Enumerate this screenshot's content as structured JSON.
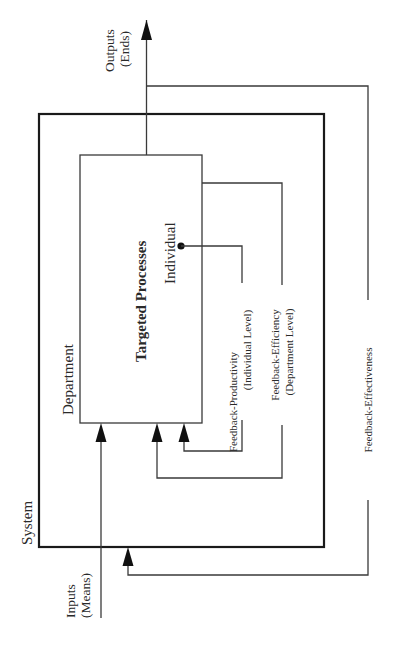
{
  "diagram": {
    "orientation": "rotated-90-ccw",
    "labels": {
      "system": "System",
      "department": "Department",
      "targeted_processes": "Targeted Processes",
      "individual": "Individual",
      "outputs_line1": "Outputs",
      "outputs_line2": "(Ends)",
      "inputs_line1": "Inputs",
      "inputs_line2": "(Means)",
      "fb_productivity_line1": "Feedback-Productivity",
      "fb_productivity_line2": "(Individual Level)",
      "fb_efficiency_line1": "Feedback-Efficiency",
      "fb_efficiency_line2": "(Department Level)",
      "fb_effectiveness": "Feedback-Effectiveness"
    },
    "nodes": [
      {
        "id": "system",
        "label": "System",
        "type": "outer-box"
      },
      {
        "id": "department",
        "label": "Department",
        "type": "region"
      },
      {
        "id": "targeted-processes",
        "label": "Targeted Processes",
        "type": "inner-box"
      },
      {
        "id": "individual",
        "label": "Individual",
        "type": "point"
      }
    ],
    "edges": [
      {
        "from": "inputs",
        "to": "targeted-processes",
        "label": "Inputs (Means)"
      },
      {
        "from": "targeted-processes",
        "to": "outputs",
        "label": "Outputs (Ends)"
      },
      {
        "from": "individual",
        "to": "targeted-processes",
        "label": "Feedback-Productivity (Individual Level)"
      },
      {
        "from": "targeted-processes",
        "to": "targeted-processes",
        "label": "Feedback-Efficiency (Department Level)"
      },
      {
        "from": "outputs",
        "to": "system",
        "label": "Feedback-Effectiveness"
      }
    ],
    "colors": {
      "line": "#3a3a3a",
      "heavy_line": "#1a1a1a",
      "text": "#2a2a2a",
      "background": "#ffffff"
    }
  }
}
